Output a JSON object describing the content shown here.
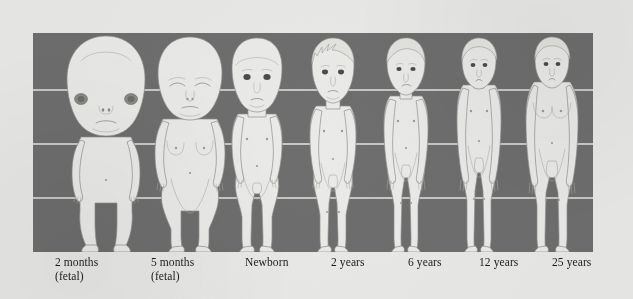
{
  "figure": {
    "panel_color": "#6e6e6e",
    "page_color": "#e9e9e7",
    "body_color": "#eaeae8",
    "gridline_color": "#e6e6e4",
    "outline_color": "#8f8f8f",
    "panel": {
      "x": 33,
      "y": 33,
      "width": 560,
      "height": 219
    },
    "gridlines_y": [
      57,
      111,
      165
    ],
    "stages": [
      {
        "id": "stage-2-months-fetal",
        "label_line1": "2 months",
        "label_line2": "(fetal)",
        "label_x": 22,
        "center_x": 73,
        "head_ratio": "1/2",
        "has_hair": false,
        "eye_style": "lateral-patch"
      },
      {
        "id": "stage-5-months-fetal",
        "label_line1": "5 months",
        "label_line2": "(fetal)",
        "label_x": 118,
        "center_x": 148,
        "head_ratio": "1/3",
        "has_hair": false,
        "eye_style": "closed"
      },
      {
        "id": "stage-newborn",
        "label_line1": "Newborn",
        "label_line2": "",
        "label_x": 212,
        "center_x": 225,
        "head_ratio": "1/4",
        "has_hair": false,
        "eye_style": "dark-open"
      },
      {
        "id": "stage-2-years",
        "label_line1": "2 years",
        "label_line2": "",
        "label_x": 298,
        "center_x": 300,
        "head_ratio": "1/5",
        "has_hair": true,
        "eye_style": "dark-open"
      },
      {
        "id": "stage-6-years",
        "label_line1": "6 years",
        "label_line2": "",
        "label_x": 375,
        "center_x": 373,
        "head_ratio": "1/6",
        "has_hair": true,
        "eye_style": "dark-open"
      },
      {
        "id": "stage-12-years",
        "label_line1": "12 years",
        "label_line2": "",
        "label_x": 446,
        "center_x": 446,
        "head_ratio": "1/7",
        "has_hair": true,
        "eye_style": "dark-open"
      },
      {
        "id": "stage-25-years",
        "label_line1": "25 years",
        "label_line2": "",
        "label_x": 519,
        "center_x": 519,
        "head_ratio": "1/8",
        "has_hair": true,
        "eye_style": "dark-open"
      }
    ]
  }
}
